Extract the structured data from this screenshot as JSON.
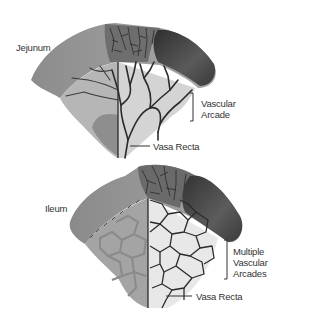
{
  "diagram": {
    "panels": [
      {
        "id": "jejunum",
        "title": "Jejunum",
        "annotations": [
          {
            "text_lines": [
              "Vascular",
              "Arcade"
            ],
            "pointer": "bracket"
          },
          {
            "text_lines": [
              "Vasa Recta"
            ],
            "pointer": "line"
          }
        ]
      },
      {
        "id": "ileum",
        "title": "Ileum",
        "annotations": [
          {
            "text_lines": [
              "Multiple",
              "Vascular",
              "Arcades"
            ],
            "pointer": "bracket"
          },
          {
            "text_lines": [
              "Vasa Recta"
            ],
            "pointer": "line"
          }
        ]
      }
    ]
  },
  "colors": {
    "intestine_light": "#9a9a9a",
    "intestine_dark": "#555555",
    "lumen": "#3a3a3a",
    "mesentery": "#c8c8c8",
    "vessels": "#2b2b2b",
    "text": "#333333"
  }
}
